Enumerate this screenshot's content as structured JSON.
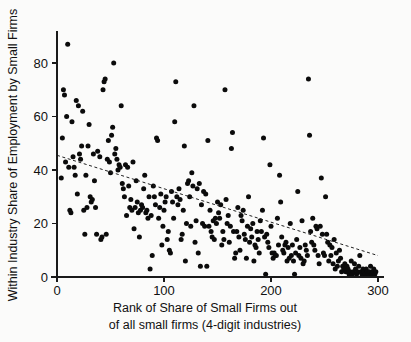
{
  "chart_data": {
    "type": "scatter",
    "title": "",
    "xlabel": "Rank of Share of Small Firms out of all small firms (4-digit industries)",
    "xlabel_line1": "Rank of Share of Small Firms out",
    "xlabel_line2": "of all small firms (4-digit industries)",
    "ylabel": "Within Industry Share of Employment by Small Firms",
    "xlim": [
      -6,
      306
    ],
    "ylim": [
      -2,
      92
    ],
    "xticks": [
      0,
      100,
      200,
      300
    ],
    "xtick_labels": [
      "0",
      "100",
      "200",
      "300"
    ],
    "yticks": [
      0,
      20,
      40,
      60,
      80
    ],
    "ytick_labels": [
      "0",
      "20",
      "40",
      "60",
      "80"
    ],
    "grid": false,
    "legend": null,
    "marker": "circle",
    "marker_color": "#0b0b0b",
    "marker_size": 5,
    "trendline": {
      "type": "linear-fit",
      "style": "dashed",
      "color": "#222222",
      "x_start": 0,
      "y_start": 45.5,
      "x_end": 300,
      "y_end": 8.0
    },
    "x": [
      4,
      5,
      6,
      7,
      8,
      9,
      10,
      11,
      12,
      13,
      14,
      15,
      16,
      17,
      18,
      19,
      20,
      21,
      22,
      23,
      24,
      25,
      26,
      27,
      28,
      29,
      30,
      31,
      32,
      33,
      34,
      35,
      36,
      37,
      38,
      40,
      41,
      42,
      43,
      44,
      45,
      46,
      47,
      48,
      49,
      50,
      51,
      52,
      53,
      54,
      55,
      56,
      57,
      58,
      59,
      60,
      61,
      62,
      63,
      64,
      65,
      66,
      67,
      68,
      69,
      70,
      71,
      72,
      73,
      74,
      75,
      76,
      77,
      78,
      79,
      80,
      81,
      82,
      83,
      84,
      85,
      86,
      87,
      88,
      89,
      90,
      91,
      92,
      93,
      94,
      95,
      96,
      97,
      98,
      99,
      100,
      101,
      102,
      103,
      104,
      105,
      106,
      107,
      108,
      109,
      110,
      111,
      112,
      113,
      114,
      115,
      116,
      117,
      118,
      119,
      120,
      121,
      122,
      123,
      124,
      125,
      126,
      127,
      128,
      129,
      130,
      131,
      132,
      133,
      134,
      135,
      136,
      137,
      138,
      139,
      140,
      141,
      142,
      143,
      144,
      145,
      146,
      147,
      148,
      149,
      150,
      151,
      152,
      153,
      154,
      155,
      156,
      157,
      158,
      159,
      160,
      161,
      162,
      163,
      164,
      165,
      166,
      167,
      168,
      169,
      170,
      171,
      172,
      173,
      174,
      175,
      176,
      177,
      178,
      179,
      180,
      181,
      182,
      183,
      184,
      185,
      186,
      187,
      188,
      189,
      190,
      191,
      192,
      193,
      194,
      195,
      196,
      197,
      198,
      199,
      200,
      201,
      202,
      203,
      204,
      205,
      206,
      207,
      208,
      209,
      210,
      211,
      212,
      213,
      214,
      215,
      216,
      217,
      218,
      219,
      220,
      221,
      222,
      223,
      224,
      225,
      226,
      227,
      228,
      229,
      230,
      231,
      232,
      233,
      234,
      235,
      236,
      237,
      238,
      239,
      240,
      241,
      242,
      243,
      244,
      245,
      246,
      247,
      248,
      249,
      250,
      251,
      252,
      253,
      254,
      255,
      256,
      257,
      258,
      259,
      260,
      261,
      262,
      263,
      264,
      265,
      266,
      267,
      268,
      269,
      270,
      271,
      272,
      273,
      274,
      275,
      276,
      277,
      278,
      279,
      280,
      281,
      282,
      283,
      284,
      285,
      286,
      287,
      288,
      289,
      290,
      291,
      292,
      293,
      294,
      295,
      296,
      297,
      298
    ],
    "y": [
      37,
      52,
      70,
      68,
      43,
      60,
      87,
      41,
      25,
      24,
      58,
      45,
      41,
      38,
      66,
      31,
      64,
      46,
      44,
      49,
      62,
      25,
      16,
      38,
      26,
      49,
      57,
      30,
      28,
      29,
      46,
      36,
      26,
      16,
      47,
      45,
      14,
      15,
      70,
      73,
      74,
      16,
      44,
      51,
      43,
      39,
      53,
      56,
      80,
      46,
      48,
      44,
      40,
      42,
      41,
      64,
      35,
      33,
      30,
      42,
      23,
      41,
      34,
      26,
      29,
      25,
      43,
      18,
      26,
      36,
      28,
      24,
      15,
      25,
      27,
      26,
      33,
      38,
      24,
      25,
      22,
      30,
      3,
      23,
      8,
      34,
      30,
      27,
      52,
      51,
      22,
      26,
      31,
      12,
      19,
      25,
      28,
      30,
      14,
      17,
      10,
      9,
      32,
      28,
      22,
      58,
      73,
      30,
      27,
      33,
      29,
      14,
      16,
      25,
      49,
      6,
      20,
      35,
      36,
      30,
      19,
      39,
      34,
      64,
      13,
      21,
      33,
      9,
      35,
      4,
      27,
      20,
      32,
      19,
      31,
      4,
      51,
      19,
      25,
      17,
      15,
      21,
      14,
      22,
      20,
      28,
      24,
      22,
      27,
      12,
      17,
      14,
      70,
      29,
      20,
      23,
      13,
      19,
      48,
      54,
      17,
      7,
      9,
      17,
      26,
      15,
      10,
      23,
      21,
      25,
      16,
      14,
      7,
      19,
      30,
      13,
      18,
      15,
      20,
      6,
      12,
      11,
      17,
      14,
      9,
      21,
      17,
      25,
      52,
      15,
      1,
      16,
      13,
      11,
      42,
      19,
      9,
      7,
      9,
      8,
      8,
      22,
      12,
      38,
      28,
      15,
      10,
      9,
      12,
      13,
      6,
      11,
      7,
      20,
      8,
      12,
      6,
      1,
      9,
      14,
      32,
      8,
      11,
      7,
      21,
      5,
      6,
      12,
      10,
      8,
      74,
      53,
      17,
      13,
      22,
      12,
      10,
      19,
      18,
      8,
      5,
      19,
      37,
      16,
      9,
      8,
      30,
      16,
      13,
      6,
      12,
      8,
      11,
      5,
      14,
      3,
      9,
      4,
      6,
      10,
      7,
      2,
      4,
      3,
      5,
      2,
      4,
      3,
      1,
      2,
      6,
      1,
      2,
      5,
      3,
      1,
      2,
      4,
      8,
      2,
      1,
      3,
      2,
      1,
      3,
      2,
      1,
      2,
      4,
      1,
      2,
      3,
      1,
      2
    ]
  }
}
